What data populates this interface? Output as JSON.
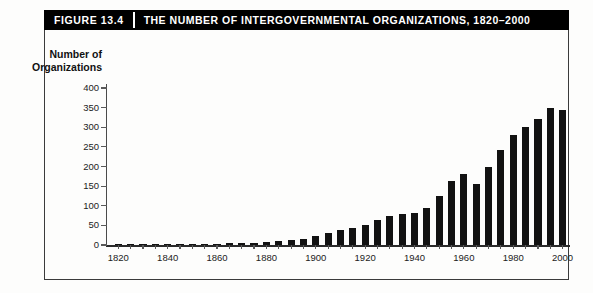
{
  "figure": {
    "number_label": "FIGURE 13.4",
    "title": "THE NUMBER OF INTERGOVERNMENTAL ORGANIZATIONS, 1820–2000"
  },
  "axis": {
    "y_label_line1": "Number of",
    "y_label_line2": "Organizations",
    "y_ticks": [
      "400",
      "350",
      "300",
      "250",
      "200",
      "150",
      "100",
      "50",
      "0"
    ],
    "x_ticks": [
      "1820",
      "1840",
      "1860",
      "1880",
      "1900",
      "1920",
      "1940",
      "1960",
      "1980",
      "2000"
    ]
  },
  "colors": {
    "bar": "#121212",
    "title_bg": "#000000",
    "title_text": "#ffffff",
    "frame": "#3b3b3b",
    "background": "#fdfdfc"
  },
  "chart_data": {
    "type": "bar",
    "title": "THE NUMBER OF INTERGOVERNMENTAL ORGANIZATIONS, 1820–2000",
    "xlabel": "",
    "ylabel": "Number of Organizations",
    "ylim": [
      0,
      400
    ],
    "xlim": [
      1815,
      2003
    ],
    "y_tick_values": [
      0,
      50,
      100,
      150,
      200,
      250,
      300,
      350,
      400
    ],
    "x_tick_values": [
      1820,
      1840,
      1860,
      1880,
      1900,
      1920,
      1940,
      1960,
      1980,
      2000
    ],
    "grid": false,
    "legend": null,
    "categories": [
      1820,
      1825,
      1830,
      1835,
      1840,
      1845,
      1850,
      1855,
      1860,
      1865,
      1870,
      1875,
      1880,
      1885,
      1890,
      1895,
      1900,
      1905,
      1910,
      1915,
      1920,
      1925,
      1930,
      1935,
      1940,
      1945,
      1950,
      1955,
      1960,
      1965,
      1970,
      1975,
      1980,
      1985,
      1990,
      1995,
      2000
    ],
    "values": [
      1,
      1,
      2,
      2,
      2,
      2,
      2,
      3,
      3,
      4,
      5,
      6,
      7,
      9,
      12,
      16,
      22,
      30,
      38,
      43,
      52,
      63,
      75,
      80,
      82,
      95,
      124,
      164,
      180,
      155,
      200,
      243,
      280,
      300,
      320,
      350,
      345
    ]
  }
}
